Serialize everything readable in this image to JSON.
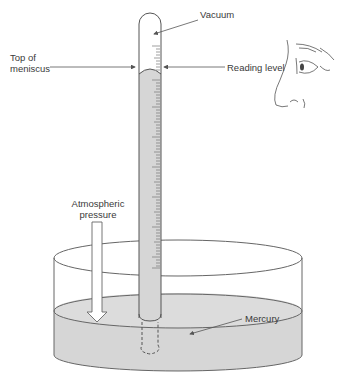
{
  "figure": {
    "labels": {
      "vacuum": "Vacuum",
      "top_of_meniscus_line1": "Top of",
      "top_of_meniscus_line2": "meniscus",
      "reading_level": "Reading level",
      "atmospheric_line1": "Atmospheric",
      "atmospheric_line2": "pressure",
      "mercury": "Mercury"
    },
    "colors": {
      "line": "#555555",
      "mercury_fill": "#d6d6d6",
      "background": "#ffffff"
    },
    "parts": [
      "glass-tube",
      "scale",
      "vacuum",
      "meniscus",
      "mercury-column",
      "dish",
      "mercury-pool",
      "observer-eye"
    ]
  }
}
